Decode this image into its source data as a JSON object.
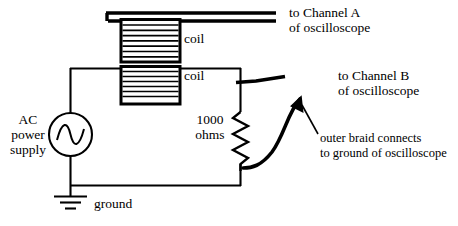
{
  "figure": {
    "type": "circuit-diagram",
    "background_color": "#ffffff",
    "line_color": "#000000"
  },
  "labels": {
    "channel_a_line1": "to Channel A",
    "channel_a_line2": "of oscilloscope",
    "channel_b_line1": "to Channel B",
    "channel_b_line2": "of oscilloscope",
    "coil_top": "coil",
    "coil_bottom": "coil",
    "resistor_line1": "1000",
    "resistor_line2": "ohms",
    "source_line1": "AC",
    "source_line2": "power",
    "source_line3": "supply",
    "ground": "ground",
    "braid_line1": "outer braid connects",
    "braid_line2": "to ground of oscilloscope"
  },
  "components": [
    {
      "name": "ac-power-supply",
      "symbol": "sine-source",
      "label": "AC power supply"
    },
    {
      "name": "coil-primary",
      "symbol": "rectangular-winding",
      "label": "coil"
    },
    {
      "name": "coil-secondary",
      "symbol": "rectangular-winding",
      "label": "coil"
    },
    {
      "name": "resistor",
      "symbol": "zigzag",
      "label": "1000 ohms",
      "value": "1000",
      "unit": "ohms"
    },
    {
      "name": "ground",
      "symbol": "earth-ground",
      "label": "ground"
    },
    {
      "name": "coax-channel-a",
      "symbol": "twin-lead",
      "label": "to Channel A of oscilloscope"
    },
    {
      "name": "coax-channel-b",
      "symbol": "lead-with-braid",
      "label": "to Channel B of oscilloscope"
    }
  ]
}
